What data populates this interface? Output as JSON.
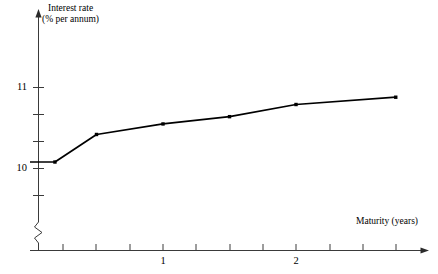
{
  "chart_data": {
    "type": "line",
    "title": "",
    "subtitle": "",
    "xlabel": "Maturity (years)",
    "ylabel": "Interest rate",
    "ylabel_line2": "(% per annum)",
    "ylabel_full": "Interest rate (% per annum)",
    "x": [
      0.0,
      0.1875,
      0.5,
      1.0,
      1.5,
      2.0,
      2.75
    ],
    "y": [
      10.08,
      10.08,
      10.42,
      10.55,
      10.64,
      10.79,
      10.88
    ],
    "series": [
      {
        "name": "Zero-coupon yield curve",
        "x": [
          0.0,
          0.1875,
          0.5,
          1.0,
          1.5,
          2.0,
          2.75
        ],
        "values": [
          10.08,
          10.08,
          10.42,
          10.55,
          10.64,
          10.79,
          10.88
        ]
      }
    ],
    "markers": [
      {
        "x": 0.1875,
        "y": 10.08
      },
      {
        "x": 0.5,
        "y": 10.42
      },
      {
        "x": 1.0,
        "y": 10.55
      },
      {
        "x": 1.5,
        "y": 10.64
      },
      {
        "x": 2.0,
        "y": 10.79
      },
      {
        "x": 2.75,
        "y": 10.88
      }
    ],
    "xlim": [
      0.0,
      3.0
    ],
    "ylim": [
      9.25,
      11.45
    ],
    "xticks": [
      0.25,
      0.5,
      0.75,
      1.0,
      1.25,
      1.5,
      1.75,
      2.0,
      2.25,
      2.5,
      2.75
    ],
    "xtick_labels": [
      {
        "value": 1.0,
        "label": "1"
      },
      {
        "value": 2.0,
        "label": "2"
      }
    ],
    "yticks": [
      9.67,
      10.0,
      10.33,
      10.67,
      11.0
    ],
    "ytick_labels": [
      {
        "value": 10.0,
        "label": "10"
      },
      {
        "value": 11.0,
        "label": "11"
      }
    ],
    "grid": false,
    "legend": false,
    "legend_position": "none",
    "y_axis_break": true,
    "x_axis_arrow": true,
    "y_axis_arrow": true,
    "line_color": "#000000",
    "marker_color": "#000000",
    "axis_color": "#3a3a3a",
    "background_color": "#ffffff"
  },
  "axes": {
    "y_title_line1": "Interest rate",
    "y_title_line2": "(% per annum)",
    "x_title": "Maturity (years)",
    "y_label_low": "10",
    "y_label_high": "11",
    "x_label_one": "1",
    "x_label_two": "2"
  }
}
